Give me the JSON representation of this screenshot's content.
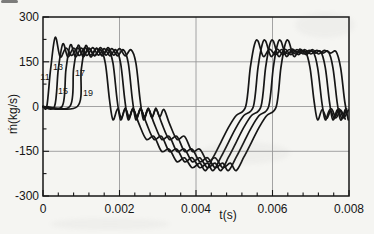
{
  "chart_data": {
    "type": "line",
    "xlabel": "t(s)",
    "ylabel": "ṁ(kg/s)",
    "xlim": [
      0,
      0.008
    ],
    "ylim": [
      -300,
      300
    ],
    "x_ticks": {
      "major": [
        0,
        0.002,
        0.004,
        0.006,
        0.008
      ],
      "labels": [
        "0",
        "0.002",
        "0.004",
        "0.006",
        "0.008"
      ],
      "minor_step": 0.0004
    },
    "y_ticks": {
      "major": [
        -300,
        -150,
        0,
        150,
        300
      ],
      "labels": [
        "-300",
        "-150",
        "0",
        "150",
        "300"
      ],
      "minor_step": 75
    },
    "grid": {
      "x": [
        0.002,
        0.004,
        0.006
      ],
      "y": [
        -150,
        0,
        150
      ]
    },
    "line_color": "#161616",
    "grid_color": "#9a9a9a",
    "background": "#f5f5f2",
    "legend": "inline curve labels near first rising edges",
    "series": [
      {
        "name": "11",
        "start_us": 100,
        "first_peak": 232
      },
      {
        "name": "13",
        "start_us": 300,
        "first_peak": 210
      },
      {
        "name": "15",
        "start_us": 500,
        "first_peak": 207
      },
      {
        "name": "17",
        "start_us": 700,
        "first_peak": 205
      },
      {
        "name": "19",
        "start_us": 900,
        "first_peak": 204
      }
    ],
    "waveform_note": "each series is the same pulse waveform shifted by start_us; time in microseconds, flow in kg/s; values[peak_index] is replaced by series first_peak",
    "waveform": {
      "peak_index": 2,
      "tau_us": [
        0,
        100,
        220,
        350,
        500,
        650,
        800,
        950,
        1100,
        1250,
        1400,
        1530,
        1640,
        1730,
        1850,
        1950,
        2050,
        2150,
        2260,
        2400,
        2600,
        2800,
        3000,
        3200,
        3400,
        3600,
        3800,
        4000,
        4150,
        4350,
        4550,
        4750,
        4950,
        5200,
        5320,
        5430,
        5520,
        5660,
        5820,
        5980,
        6140,
        6300,
        6460,
        6620,
        6760,
        6880,
        6990,
        7080,
        7200,
        7320,
        7440,
        7560,
        7680,
        7800,
        7920
      ],
      "values": [
        0,
        125,
        210,
        166,
        196,
        171,
        197,
        172,
        194,
        170,
        190,
        145,
        20,
        -45,
        -8,
        -38,
        -5,
        -35,
        -10,
        -55,
        -110,
        -100,
        -150,
        -143,
        -185,
        -172,
        -205,
        -190,
        -215,
        -170,
        -120,
        -70,
        -30,
        0,
        130,
        208,
        220,
        168,
        192,
        174,
        191,
        176,
        188,
        179,
        184,
        130,
        15,
        -45,
        -10,
        -40,
        -8,
        -38,
        -12,
        -42,
        -15
      ]
    },
    "curve_labels": [
      {
        "text": "11",
        "x": 45,
        "y": 77
      },
      {
        "text": "13",
        "x": 58,
        "y": 67
      },
      {
        "text": "15",
        "x": 63,
        "y": 91
      },
      {
        "text": "17",
        "x": 80,
        "y": 73
      },
      {
        "text": "19",
        "x": 88,
        "y": 93
      }
    ]
  }
}
